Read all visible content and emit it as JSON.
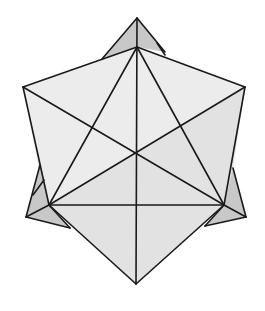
{
  "figure": {
    "type": "geometric-solid",
    "colors": {
      "background": "#ffffff",
      "edge": "#1a1a1a",
      "face_light": "#ececec",
      "face_mid": "#e2e2e2",
      "face_dark": "#c8c8c8"
    },
    "vertices": {
      "top_tip": [
        137,
        18
      ],
      "top_inner": [
        137,
        47
      ],
      "upper_left": [
        23,
        87
      ],
      "upper_right": [
        245,
        87
      ],
      "center": [
        136,
        152
      ],
      "lower_left_inner": [
        49,
        205
      ],
      "lower_right_inner": [
        224,
        205
      ],
      "lower_left_tip": [
        26,
        217
      ],
      "lower_right_tip": [
        246,
        217
      ],
      "bottom_tip": [
        136,
        284
      ]
    }
  }
}
